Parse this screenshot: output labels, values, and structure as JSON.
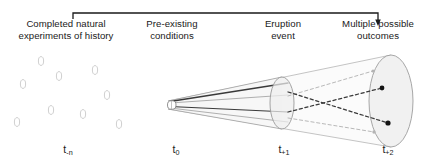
{
  "figure": {
    "background": "#ffffff",
    "width": 427,
    "height": 168
  },
  "top_bracket": {
    "name": "time-axis-bracket",
    "x_start": 73,
    "x_end": 378,
    "y": 13,
    "has_arrowhead_right": true,
    "color": "#1a1a1a"
  },
  "headers": [
    {
      "id": "completed-natural-experiments",
      "text": "Completed natural\nexperiments of history"
    },
    {
      "id": "pre-existing-conditions",
      "text": "Pre-existing\nconditions"
    },
    {
      "id": "eruption-event",
      "text": "Eruption\nevent"
    },
    {
      "id": "multiple-possible-outcomes",
      "text": "Multiple possible\noutcomes"
    }
  ],
  "time_labels": [
    {
      "id": "t-minus-n",
      "base": "t",
      "sub": "-n"
    },
    {
      "id": "t-zero",
      "base": "t",
      "sub": "0"
    },
    {
      "id": "t-plus-1",
      "base": "t",
      "sub": "+1"
    },
    {
      "id": "t-plus-2",
      "base": "t",
      "sub": "+2"
    }
  ],
  "history_ellipses": {
    "name": "past-events-cluster",
    "stroke": "#c8c8c8",
    "rx": 2.6,
    "ry": 4.4,
    "points": [
      {
        "cx": 41,
        "cy": 61
      },
      {
        "cx": 95,
        "cy": 70
      },
      {
        "cx": 23,
        "cy": 84
      },
      {
        "cx": 59,
        "cy": 76
      },
      {
        "cx": 107,
        "cy": 95
      },
      {
        "cx": 51,
        "cy": 110
      },
      {
        "cx": 17,
        "cy": 122
      },
      {
        "cx": 83,
        "cy": 114
      },
      {
        "cx": 119,
        "cy": 124
      }
    ]
  },
  "cone": {
    "name": "possibility-cone",
    "apex_x": 168,
    "apex_y": 105,
    "apex_half_height": 4,
    "t1_x": 282,
    "t1_ry": 26,
    "t2_x": 393,
    "t2_ry": 47,
    "fill": "#fafafa",
    "stroke": "#b4b4b4"
  },
  "t1_ellipse": {
    "name": "eruption-event-ellipse",
    "cx": 282,
    "cy": 103,
    "rx": 12,
    "ry": 26,
    "fill": "#f2f2f2",
    "stroke": "#999999"
  },
  "t2_ellipse": {
    "name": "outcomes-ellipse",
    "cx": 391,
    "cy": 101,
    "rx": 22,
    "ry": 46,
    "fill": "#f2f2f2",
    "stroke": "#9a9a9a"
  },
  "solid_trajectories": {
    "name": "pre-existing-condition-paths",
    "stroke_dark": "#3a3a3a",
    "stroke_mid": "#8c8c8c",
    "paths": [
      {
        "id": "path-upper-dark",
        "y_end": 83,
        "color": "#3a3a3a",
        "width": 1.4
      },
      {
        "id": "path-mid-upper",
        "y_end": 96,
        "color": "#9a9a9a",
        "width": 0.9
      },
      {
        "id": "path-mid-lower",
        "y_end": 112,
        "color": "#3a3a3a",
        "width": 1.2
      },
      {
        "id": "path-lower",
        "y_end": 122,
        "color": "#9a9a9a",
        "width": 0.9
      }
    ]
  },
  "dashed_trajectories": {
    "name": "possible-outcome-paths",
    "count": 4,
    "paths": [
      {
        "id": "outcome-a",
        "start_y": 96,
        "end_x": 373,
        "end_y": 71,
        "color": "#b0b0b0",
        "width": 0.9,
        "endpoint": "light"
      },
      {
        "id": "outcome-b",
        "start_y": 112,
        "end_x": 382,
        "end_y": 88,
        "color": "#3a3a3a",
        "width": 1.2,
        "endpoint": "dark"
      },
      {
        "id": "outcome-c",
        "start_y": 92,
        "end_x": 388,
        "end_y": 123,
        "color": "#3a3a3a",
        "width": 1.2,
        "endpoint": "dark"
      },
      {
        "id": "outcome-d",
        "start_y": 118,
        "end_x": 374,
        "end_y": 132,
        "color": "#b0b0b0",
        "width": 0.9,
        "endpoint": "light"
      }
    ],
    "endpoint_dark_color": "#1a1a1a",
    "endpoint_light_color": "#b0b0b0"
  },
  "origin_tube": {
    "name": "initial-conditions-tube",
    "x": 168,
    "y": 101,
    "width": 9,
    "height": 8,
    "stroke": "#7a7a7a"
  }
}
